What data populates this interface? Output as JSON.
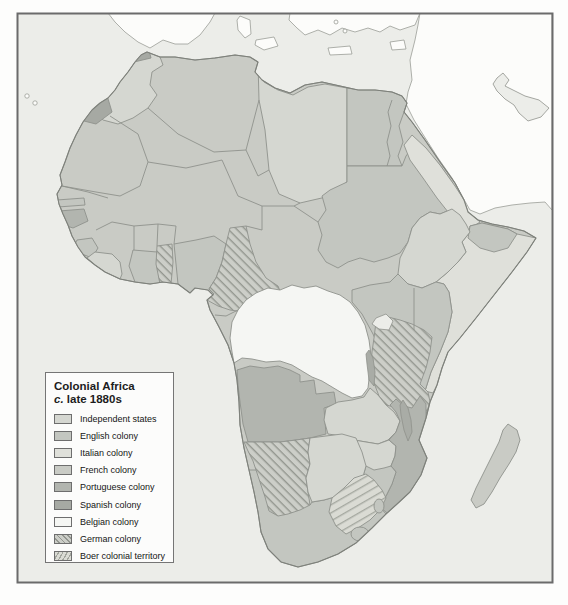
{
  "map": {
    "title": "Colonial Africa",
    "subtitle_italic": "c.",
    "subtitle_text": " late 1880s"
  },
  "legend": {
    "items": [
      {
        "id": "independent",
        "label": "Independent states",
        "category": "independent"
      },
      {
        "id": "english",
        "label": "English colony",
        "category": "english"
      },
      {
        "id": "italian",
        "label": "Italian colony",
        "category": "italian"
      },
      {
        "id": "french",
        "label": "French colony",
        "category": "french"
      },
      {
        "id": "portuguese",
        "label": "Portuguese colony",
        "category": "portuguese"
      },
      {
        "id": "spanish",
        "label": "Spanish colony",
        "category": "spanish"
      },
      {
        "id": "belgian",
        "label": "Belgian colony",
        "category": "belgian"
      },
      {
        "id": "german",
        "label": "German colony",
        "category": "german"
      },
      {
        "id": "boer",
        "label": "Boer colonial territory",
        "category": "boer"
      }
    ]
  },
  "colors": {
    "sea": "#ecede9",
    "other_land": "#fcfcfa",
    "frame": "#6b6b6b",
    "independent": "#d5d7d1",
    "english": "#c3c6c0",
    "italian": "#dfe0da",
    "french": "#c9cbc5",
    "portuguese": "#b2b5af",
    "spanish": "#a6a9a3",
    "belgian": "#f5f6f3",
    "german_bg": "#cccec8",
    "german_line": "#93968f",
    "boer_bg": "#dadbd4",
    "boer_line": "#a2a59d",
    "lake_dark": "#a9aca6"
  },
  "regions": {
    "french_africa_base": "french",
    "morocco": "independent",
    "spanish_morocco": "spanish",
    "rio_de_oro": "spanish",
    "libya": "independent",
    "egypt": "english",
    "sudan": "english",
    "red_sea_coast": "italian",
    "ethiopia": "independent",
    "british_somaliland": "english",
    "somalia": "italian",
    "kenya_uganda": "english",
    "tanzania": "german",
    "gambia": "english",
    "portuguese_guinea": "portuguese",
    "sierra_leone": "english",
    "liberia": "independent",
    "gold_coast": "english",
    "togo": "german",
    "nigeria": "english",
    "cameroon": "german",
    "congo_free_state": "belgian",
    "angola": "portuguese",
    "german_southwest_africa": "german",
    "bechuanaland": "independent",
    "zambia": "independent",
    "zimbabwe": "independent",
    "mozambique": "portuguese",
    "south_africa": "english",
    "boer_republics": "boer",
    "lesotho": "english",
    "swaziland": "english",
    "madagascar": "french"
  }
}
